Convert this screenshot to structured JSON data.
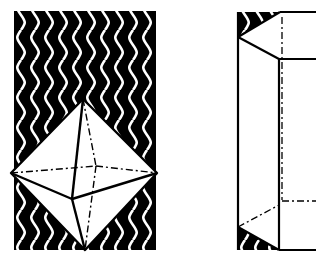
{
  "figure": {
    "title": "Crystal forms: octahedron and prism with pyramidal terminations",
    "colors": {
      "background": "#ffffff",
      "ink": "#000000",
      "pattern_light": "#ffffff"
    },
    "left_panel": {
      "label": "Octahedron on wavy patterned background",
      "background_pattern": "wavy-vertical-lines"
    },
    "right_panel": {
      "label": "Prism with pyramidal ends (cropped)",
      "background_pattern": "wavy-vertical-lines"
    }
  }
}
